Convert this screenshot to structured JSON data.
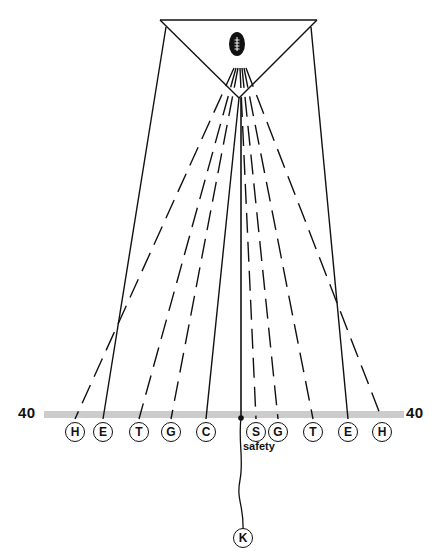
{
  "diagram": {
    "colors": {
      "ink": "#111111",
      "yard_line": "#cccccc",
      "background": "#ffffff"
    },
    "yard_line": {
      "left_label": "40",
      "right_label": "40"
    },
    "ball_icon": "football-icon",
    "players_line": [
      {
        "id": "h-left",
        "label": "H",
        "x": 75
      },
      {
        "id": "e-left",
        "label": "E",
        "x": 103
      },
      {
        "id": "t-left",
        "label": "T",
        "x": 139
      },
      {
        "id": "g-left",
        "label": "G",
        "x": 171
      },
      {
        "id": "c",
        "label": "C",
        "x": 206
      },
      {
        "id": "s",
        "label": "S",
        "x": 256
      },
      {
        "id": "g-right",
        "label": "G",
        "x": 278
      },
      {
        "id": "t-right",
        "label": "T",
        "x": 313
      },
      {
        "id": "e-right",
        "label": "E",
        "x": 348
      },
      {
        "id": "h-right",
        "label": "H",
        "x": 382
      }
    ],
    "kicker": {
      "label": "K",
      "x": 243
    },
    "safety_label": "safety"
  }
}
